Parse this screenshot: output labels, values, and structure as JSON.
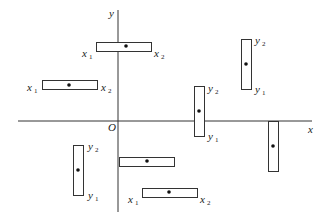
{
  "diagram": {
    "title": "",
    "axes": {
      "x_label": "x",
      "y_label": "y",
      "origin_label": "O",
      "x_axis": {
        "x1": 18,
        "x2": 312,
        "y": 121
      },
      "y_axis": {
        "x": 118,
        "y1": 10,
        "y2": 212
      }
    },
    "boxes": [
      {
        "id": "A",
        "orientation": "horizontal",
        "x": 96,
        "y": 42,
        "w": 55,
        "h": 9,
        "dot": [
          126,
          46
        ],
        "labels": [
          {
            "text": "x",
            "sub": "1",
            "x": 82,
            "y": 57
          },
          {
            "text": "x",
            "sub": "2",
            "x": 154,
            "y": 57
          }
        ]
      },
      {
        "id": "B",
        "orientation": "horizontal",
        "x": 42,
        "y": 80,
        "w": 55,
        "h": 9,
        "dot": [
          69,
          85
        ],
        "labels": [
          {
            "text": "x",
            "sub": "1",
            "x": 27,
            "y": 91
          },
          {
            "text": "x",
            "sub": "2",
            "x": 101,
            "y": 91
          }
        ]
      },
      {
        "id": "C",
        "orientation": "vertical",
        "x": 241,
        "y": 39,
        "w": 10,
        "h": 50,
        "dot": [
          246,
          64
        ],
        "labels": [
          {
            "text": "y",
            "sub": "2",
            "x": 255,
            "y": 44
          },
          {
            "text": "y",
            "sub": "1",
            "x": 255,
            "y": 93
          }
        ]
      },
      {
        "id": "D",
        "orientation": "vertical",
        "x": 194,
        "y": 86,
        "w": 10,
        "h": 50,
        "dot": [
          199,
          111
        ],
        "labels": [
          {
            "text": "y",
            "sub": "2",
            "x": 208,
            "y": 92
          },
          {
            "text": "y",
            "sub": "1",
            "x": 208,
            "y": 140
          }
        ]
      },
      {
        "id": "E",
        "orientation": "vertical",
        "x": 268,
        "y": 121,
        "w": 10,
        "h": 50,
        "dot": [
          273,
          146
        ],
        "labels": []
      },
      {
        "id": "F",
        "orientation": "vertical",
        "x": 73,
        "y": 145,
        "w": 10,
        "h": 50,
        "dot": [
          78,
          170
        ],
        "labels": [
          {
            "text": "y",
            "sub": "2",
            "x": 88,
            "y": 150
          },
          {
            "text": "y",
            "sub": "1",
            "x": 88,
            "y": 199
          }
        ]
      },
      {
        "id": "G",
        "orientation": "horizontal",
        "x": 119,
        "y": 157,
        "w": 55,
        "h": 9,
        "dot": [
          147,
          161
        ],
        "labels": []
      },
      {
        "id": "H",
        "orientation": "horizontal",
        "x": 142,
        "y": 188,
        "w": 55,
        "h": 9,
        "dot": [
          169,
          192
        ],
        "labels": [
          {
            "text": "x",
            "sub": "1",
            "x": 128,
            "y": 203
          },
          {
            "text": "x",
            "sub": "2",
            "x": 200,
            "y": 203
          }
        ]
      }
    ],
    "colors": {
      "stroke": "#333333",
      "background": "#ffffff",
      "dot": "#111111"
    }
  }
}
